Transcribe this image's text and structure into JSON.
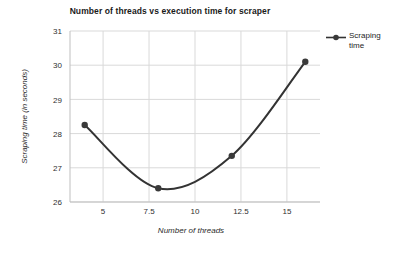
{
  "chart_data": {
    "type": "line",
    "title": "Number of threads vs execution time for scraper",
    "xlabel": "Number of threads",
    "ylabel": "Scraping time (in seconds)",
    "xlim": [
      3.2,
      16.8
    ],
    "ylim": [
      26,
      31
    ],
    "xticks": [
      "5",
      "7.5",
      "10",
      "12.5",
      "15"
    ],
    "xtick_values": [
      5,
      7.5,
      10,
      12.5,
      15
    ],
    "yticks": [
      "26",
      "27",
      "28",
      "29",
      "30",
      "31"
    ],
    "ytick_values": [
      26,
      27,
      28,
      29,
      30,
      31
    ],
    "grid": true,
    "legend_position": "right",
    "x": [
      4,
      8,
      12,
      16
    ],
    "series": [
      {
        "name": "Scraping time",
        "values": [
          28.25,
          26.4,
          27.35,
          30.1
        ],
        "color": "#333333",
        "marker": "circle",
        "smooth": true
      }
    ]
  },
  "legend": {
    "entries": [
      {
        "label_line1": "Scraping",
        "label_line2": "time",
        "color": "#333333"
      }
    ]
  },
  "colors": {
    "line": "#333333",
    "marker": "#3a3a3a",
    "grid": "#d9d9d9",
    "axis": "#bfbfbf",
    "background": "#ffffff",
    "text": "#262626"
  }
}
